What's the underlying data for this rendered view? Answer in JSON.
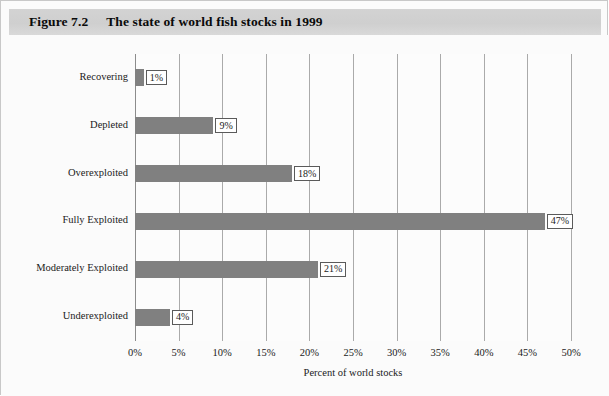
{
  "figure": {
    "number": "Figure 7.2",
    "title": "The state of world fish stocks in 1999"
  },
  "colors": {
    "bar_fill": "#808080",
    "gridline": "#aaaaaa",
    "axis_line": "#8c8c8c",
    "title_band": "#d3d3d3",
    "plot_background": "#fcfcfc",
    "figure_background": "#fbfbfb",
    "label_box_border": "#5a5a5a",
    "text": "#1a1a1a"
  },
  "chart_data": {
    "type": "bar",
    "orientation": "horizontal",
    "title": "The state of world fish stocks in 1999",
    "subtitle": "",
    "xlabel": "Percent of world stocks",
    "ylabel": "",
    "xlim": [
      0,
      50
    ],
    "ylim": null,
    "grid": true,
    "legend": false,
    "legend_position": "none",
    "xticks": [
      0,
      5,
      10,
      15,
      20,
      25,
      30,
      35,
      40,
      45,
      50
    ],
    "xticklabels": [
      "0%",
      "5%",
      "10%",
      "15%",
      "20%",
      "25%",
      "30%",
      "35%",
      "40%",
      "45%",
      "50%"
    ],
    "categories": [
      "Recovering",
      "Depleted",
      "Overexploited",
      "Fully Exploited",
      "Moderately Exploited",
      "Underexploited"
    ],
    "values": [
      1,
      9,
      18,
      47,
      21,
      4
    ],
    "data_labels": [
      "1%",
      "9%",
      "18%",
      "47%",
      "21%",
      "4%"
    ]
  }
}
